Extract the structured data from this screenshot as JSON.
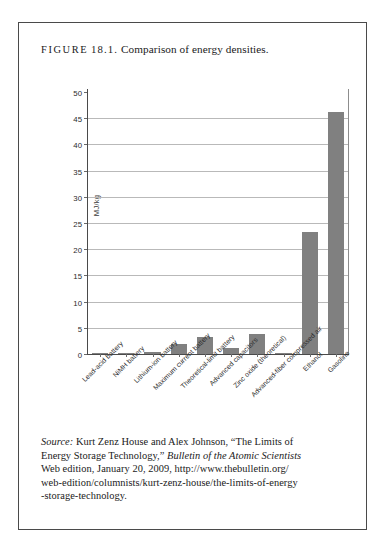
{
  "figure": {
    "label": "FIGURE",
    "number": "18.1.",
    "title": "Comparison of energy densities."
  },
  "chart_data": {
    "type": "bar",
    "title": "Comparison of energy densities.",
    "xlabel": "",
    "ylabel": "MJ/kg",
    "ylim": [
      0,
      50
    ],
    "yticks": [
      0,
      5,
      10,
      15,
      20,
      25,
      30,
      35,
      40,
      45,
      50
    ],
    "grid": true,
    "legend": "none",
    "bar_color": "#808080",
    "categories": [
      "Lead-acid battery",
      "NiMH battery",
      "Lithium-ion battery",
      "Maximum current battery",
      "Theoretical-limit battery",
      "Advanced capacitors",
      "Zinc oxide (theoretical)",
      "Advanced-fiber compressed air",
      "Ethanol",
      "Gasoline"
    ],
    "values": [
      0.15,
      0.28,
      0.4,
      2.0,
      3.2,
      1.2,
      3.9,
      0.15,
      23.4,
      46.4
    ]
  },
  "source": {
    "label": "Source:",
    "line1_rest": " Kurt Zenz House and Alex Johnson, “The Limits of",
    "line2_a": "Energy Storage Technology,” ",
    "line2_italic": "Bulletin of the Atomic Scientists",
    "line3": "Web edition, January 20, 2009, http://www.thebulletin.org/",
    "line4": "web-edition/columnists/kurt-zenz-house/the-limits-of-energy",
    "line5": "-storage-technology."
  }
}
